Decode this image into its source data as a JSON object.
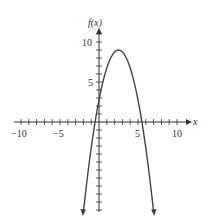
{
  "chart_data": {
    "type": "line",
    "title": "",
    "xlabel": "x",
    "ylabel": "f(x)",
    "xlim": [
      -11,
      11
    ],
    "ylim": [
      -11.5,
      12
    ],
    "x_ticks": [
      -10,
      -5,
      5,
      10
    ],
    "y_ticks": [
      5,
      10
    ],
    "grid": false,
    "series": [
      {
        "name": "f(x)",
        "function": "-x^2 + 5x + 2.75",
        "x": [
          -2,
          -1,
          -0.5,
          0,
          1,
          2,
          2.5,
          3,
          4,
          5,
          5.5,
          6,
          7
        ],
        "values": [
          -11.25,
          -3.25,
          0,
          2.75,
          6.75,
          8.75,
          9,
          8.75,
          6.75,
          2.75,
          0,
          -3.25,
          -11.25
        ]
      }
    ],
    "annotations": {
      "vertex": [
        2.5,
        9
      ],
      "roots": [
        -0.5,
        5.5
      ],
      "y_intercept": 2.75
    }
  },
  "labels": {
    "y_axis": "f(x)",
    "x_axis": "x",
    "x_tick_labels": [
      "−10",
      "−5",
      "5",
      "10"
    ],
    "y_tick_labels": [
      "5",
      "10"
    ]
  },
  "colors": {
    "axis": "#333333",
    "curve": "#444444"
  }
}
